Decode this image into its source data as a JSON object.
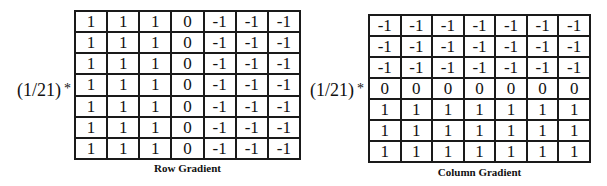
{
  "figures": [
    {
      "id": "row",
      "scale_label": "(1/21)",
      "operator": "*",
      "caption": "Row Gradient",
      "matrix": [
        [
          "1",
          "1",
          "1",
          "0",
          "-1",
          "-1",
          "-1"
        ],
        [
          "1",
          "1",
          "1",
          "0",
          "-1",
          "-1",
          "-1"
        ],
        [
          "1",
          "1",
          "1",
          "0",
          "-1",
          "-1",
          "-1"
        ],
        [
          "1",
          "1",
          "1",
          "0",
          "-1",
          "-1",
          "-1"
        ],
        [
          "1",
          "1",
          "1",
          "0",
          "-1",
          "-1",
          "-1"
        ],
        [
          "1",
          "1",
          "1",
          "0",
          "-1",
          "-1",
          "-1"
        ],
        [
          "1",
          "1",
          "1",
          "0",
          "-1",
          "-1",
          "-1"
        ]
      ]
    },
    {
      "id": "column",
      "scale_label": "(1/21)",
      "operator": "*",
      "caption": "Column Gradient",
      "matrix": [
        [
          "-1",
          "-1",
          "-1",
          "-1",
          "-1",
          "-1",
          "-1"
        ],
        [
          "-1",
          "-1",
          "-1",
          "-1",
          "-1",
          "-1",
          "-1"
        ],
        [
          "-1",
          "-1",
          "-1",
          "-1",
          "-1",
          "-1",
          "-1"
        ],
        [
          "0",
          "0",
          "0",
          "0",
          "0",
          "0",
          "0"
        ],
        [
          "1",
          "1",
          "1",
          "1",
          "1",
          "1",
          "1"
        ],
        [
          "1",
          "1",
          "1",
          "1",
          "1",
          "1",
          "1"
        ],
        [
          "1",
          "1",
          "1",
          "1",
          "1",
          "1",
          "1"
        ]
      ]
    }
  ]
}
